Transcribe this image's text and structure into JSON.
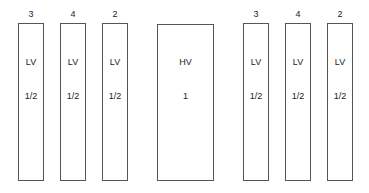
{
  "diagram": {
    "boxes": [
      {
        "id": "lv-1",
        "top_label": "3",
        "type": "LV",
        "ratio": "1/2",
        "x": 18,
        "w": 26
      },
      {
        "id": "lv-2",
        "top_label": "4",
        "type": "LV",
        "ratio": "1/2",
        "x": 60,
        "w": 26
      },
      {
        "id": "lv-3",
        "top_label": "2",
        "type": "LV",
        "ratio": "1/2",
        "x": 102,
        "w": 26
      },
      {
        "id": "hv-1",
        "top_label": "",
        "type": "HV",
        "ratio": "1",
        "x": 157,
        "w": 56
      },
      {
        "id": "lv-4",
        "top_label": "3",
        "type": "LV",
        "ratio": "1/2",
        "x": 243,
        "w": 26
      },
      {
        "id": "lv-5",
        "top_label": "4",
        "type": "LV",
        "ratio": "1/2",
        "x": 285,
        "w": 26
      },
      {
        "id": "lv-6",
        "top_label": "2",
        "type": "LV",
        "ratio": "1/2",
        "x": 327,
        "w": 26
      }
    ]
  }
}
